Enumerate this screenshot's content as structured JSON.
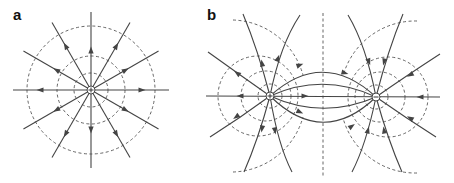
{
  "figure": {
    "panels": [
      {
        "label": "a",
        "description": "Electric field lines and equipotential circles around a single positive point charge",
        "charge": {
          "sign": "+",
          "cx": 91,
          "cy": 90
        },
        "equipotential_radii": [
          17,
          34,
          64
        ],
        "field_line_count": 12,
        "field_direction": "outward"
      },
      {
        "label": "b",
        "description": "Electric field lines and equipotential curves of an electric dipole",
        "charges": [
          {
            "sign": "+",
            "cx": 270,
            "cy": 96
          },
          {
            "sign": "−",
            "cx": 376,
            "cy": 97
          }
        ],
        "field_direction": "from positive to negative",
        "symmetry_axis_x": 323
      }
    ],
    "colors": {
      "field_line": "#444444",
      "equipotential": "#555555",
      "background": "#ffffff"
    }
  }
}
